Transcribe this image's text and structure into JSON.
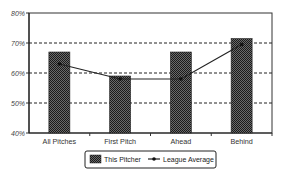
{
  "chart_data": {
    "type": "bar",
    "title": "",
    "xlabel": "",
    "ylabel": "",
    "ylim": [
      40,
      80
    ],
    "yticks": [
      "40%",
      "50%",
      "60%",
      "70%",
      "80%"
    ],
    "grid": "dashed horizontal",
    "legend_position": "bottom",
    "categories": [
      "All Pitches",
      "First Pitch",
      "Ahead",
      "Behind"
    ],
    "series": [
      {
        "name": "This Pitcher",
        "type": "bar",
        "values": [
          67,
          59,
          67,
          71.5
        ]
      },
      {
        "name": "League Average",
        "type": "line",
        "values": [
          63,
          58,
          58,
          69.5
        ]
      }
    ]
  },
  "legend": {
    "bar_label": "This Pitcher",
    "line_label": "League Average"
  }
}
